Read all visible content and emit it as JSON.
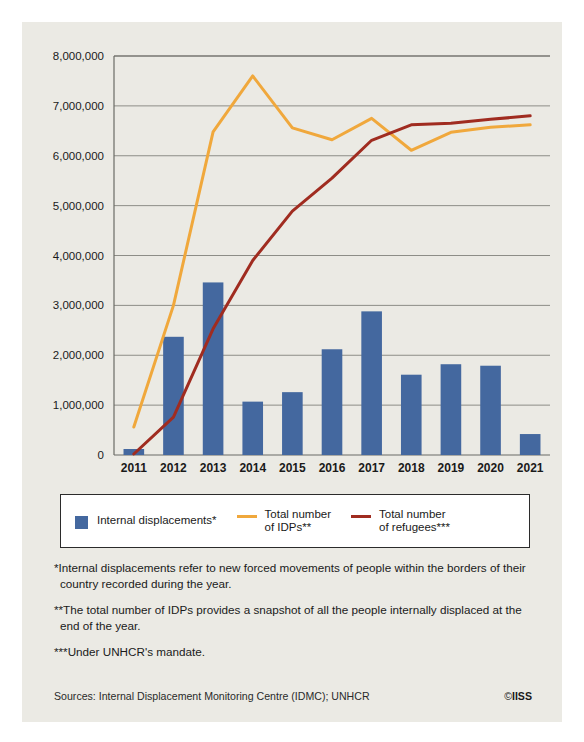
{
  "chart_data": {
    "type": "bar",
    "title": "",
    "xlabel": "",
    "ylabel": "",
    "categories": [
      "2011",
      "2012",
      "2013",
      "2014",
      "2015",
      "2016",
      "2017",
      "2018",
      "2019",
      "2020",
      "2021"
    ],
    "ylim": [
      0,
      8000000
    ],
    "ytick_values": [
      0,
      1000000,
      2000000,
      3000000,
      4000000,
      5000000,
      6000000,
      7000000,
      8000000
    ],
    "ytick_labels": [
      "0",
      "1,000,000",
      "2,000,000",
      "3,000,000",
      "4,000,000",
      "5,000,000",
      "6,000,000",
      "7,000,000",
      "8,000,000"
    ],
    "grid": true,
    "legend_position": "below-plot",
    "series": [
      {
        "name": "Internal displacements*",
        "kind": "bar",
        "color": "#44689f",
        "values": [
          120000,
          2370000,
          3460000,
          1070000,
          1260000,
          2120000,
          2880000,
          1610000,
          1820000,
          1790000,
          420000
        ]
      },
      {
        "name": "Total number of IDPs**",
        "kind": "line",
        "color": "#f0a83c",
        "values": [
          560000,
          3000000,
          6480000,
          7600000,
          6560000,
          6320000,
          6750000,
          6110000,
          6470000,
          6570000,
          6620000
        ]
      },
      {
        "name": "Total number of refugees***",
        "kind": "line",
        "color": "#a02c20",
        "values": [
          20000,
          760000,
          2530000,
          3900000,
          4890000,
          5550000,
          6310000,
          6620000,
          6650000,
          6730000,
          6800000
        ]
      }
    ]
  },
  "legend": {
    "entries": [
      {
        "label": "Internal displacements*",
        "marker": "box",
        "color": "#44689f"
      },
      {
        "label": "Total number\nof IDPs**",
        "marker": "line",
        "color": "#f0a83c"
      },
      {
        "label": "Total number\nof refugees***",
        "marker": "line",
        "color": "#a02c20"
      }
    ]
  },
  "notes": [
    "*Internal displacements refer to new forced movements of people within the borders of their country recorded during the year.",
    "**The total number of IDPs provides a snapshot of all the people internally displaced at the end of the year.",
    "***Under UNHCR's mandate."
  ],
  "sources": {
    "text": "Sources: Internal Displacement Monitoring Centre (IDMC); UNHCR",
    "copyright_symbol": "©",
    "copyright_name": "IISS"
  }
}
